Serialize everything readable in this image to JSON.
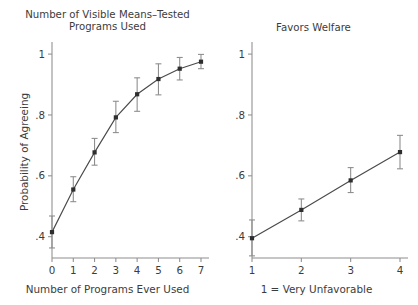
{
  "figure": {
    "background": "#ffffff",
    "axis_color": "#8e8e8e",
    "line_color": "#4a4a4a",
    "marker_color": "#2e2e2e",
    "error_color": "#8a8a8a"
  },
  "chart_data": [
    {
      "type": "line",
      "panel": "left",
      "title": "Number of Visible Means–Tested\nPrograms Used",
      "xlabel": "Number of Programs Ever Used",
      "ylabel": "Probability of Agreeing",
      "x": [
        0,
        1,
        2,
        3,
        4,
        5,
        6,
        7
      ],
      "values": [
        0.415,
        0.555,
        0.677,
        0.792,
        0.868,
        0.918,
        0.952,
        0.975
      ],
      "error_low": [
        0.363,
        0.515,
        0.635,
        0.742,
        0.812,
        0.866,
        0.915,
        0.952
      ],
      "error_high": [
        0.468,
        0.597,
        0.723,
        0.845,
        0.922,
        0.968,
        0.989,
        0.999
      ],
      "xtick_labels": [
        "0",
        "1",
        "2",
        "3",
        "4",
        "5",
        "6",
        "7"
      ],
      "ytick_labels": [
        "1",
        ".8",
        ".6",
        ".4"
      ],
      "ytick_values": [
        1,
        0.8,
        0.6,
        0.4
      ],
      "xlim": [
        0,
        7
      ],
      "ylim": [
        0.33,
        1.02
      ],
      "grid": false,
      "legend": "none",
      "marker": "square",
      "error_bars": true
    },
    {
      "type": "line",
      "panel": "right",
      "title": "Favors Welfare",
      "xlabel": "1 = Very Unfavorable",
      "ylabel": "",
      "x": [
        1,
        2,
        3,
        4
      ],
      "values": [
        0.395,
        0.488,
        0.585,
        0.678
      ],
      "error_low": [
        0.337,
        0.452,
        0.545,
        0.623
      ],
      "error_high": [
        0.455,
        0.524,
        0.627,
        0.733
      ],
      "xtick_labels": [
        "1",
        "2",
        "3",
        "4"
      ],
      "ytick_labels": [
        "1",
        ".8",
        ".6",
        ".4"
      ],
      "ytick_values": [
        1,
        0.8,
        0.6,
        0.4
      ],
      "xlim": [
        1,
        4
      ],
      "ylim": [
        0.33,
        1.02
      ],
      "grid": false,
      "legend": "none",
      "marker": "square",
      "error_bars": true
    }
  ]
}
